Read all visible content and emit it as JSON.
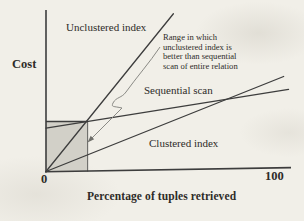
{
  "figure": {
    "background_color": "#f1efe8",
    "ink_color": "#3d3d3d",
    "shade_color": "#d2d0c8",
    "leader_color": "#8a8a85",
    "arrowhead_color": "#6f6f6a"
  },
  "labels": {
    "cost": "Cost",
    "unclustered_index": "Unclustered index",
    "sequential_scan": "Sequential scan",
    "clustered_index": "Clustered index",
    "annotation": "Range in which\nunclustered index is\nbetter than sequential\nscan of entire relation",
    "x_axis_title": "Percentage of tuples retrieved",
    "x_tick_min": "0",
    "x_tick_max": "100"
  },
  "chart_data": {
    "type": "line",
    "title": "",
    "xlabel": "Percentage of tuples retrieved",
    "ylabel": "Cost",
    "xlim": [
      0,
      100
    ],
    "x_ticks": [
      0,
      100
    ],
    "y_axis_unlabeled": true,
    "grid": false,
    "legend": "inline labels next to lines",
    "series": [
      {
        "name": "Unclustered index",
        "x": [
          0,
          52
        ],
        "y": [
          0,
          0.98
        ]
      },
      {
        "name": "Sequential scan",
        "x": [
          0,
          99
        ],
        "y": [
          0.27,
          0.51
        ]
      },
      {
        "name": "Clustered index",
        "x": [
          0,
          97
        ],
        "y": [
          0,
          0.59
        ]
      }
    ],
    "shaded_region": {
      "x_range": [
        0,
        17
      ],
      "y_range": [
        0,
        0.31
      ],
      "label": "Range in which unclustered index is better than sequential scan of entire relation"
    },
    "annotations": [
      {
        "text": "Range in which unclustered index is better than sequential scan of entire relation",
        "arrow_points_to": "right edge of shaded region"
      }
    ]
  }
}
